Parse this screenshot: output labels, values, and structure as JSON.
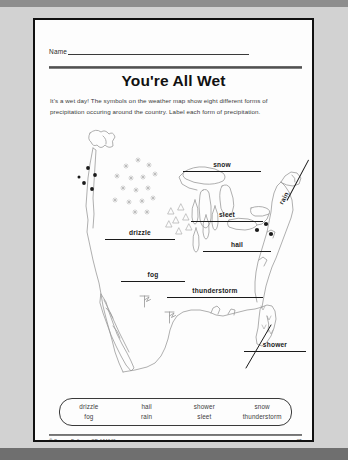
{
  "worksheet": {
    "name_label": "Name",
    "title": "You're All Wet",
    "directions": "It's a wet day! The symbols on the weather map show eight different forms of precipitation occuring around the country. Label each form of precipitation."
  },
  "map_labels": {
    "snow": "snow",
    "sleet": "sleet",
    "drizzle": "drizzle",
    "hail": "hail",
    "rain": "rain",
    "fog": "fog",
    "thunderstorm": "thunderstorm",
    "shower": "shower"
  },
  "word_bank": {
    "columns": [
      {
        "words": [
          "drizzle",
          "fog"
        ]
      },
      {
        "words": [
          "hail",
          "rain"
        ]
      },
      {
        "words": [
          "shower",
          "sleet"
        ]
      },
      {
        "words": [
          "snow",
          "thunderstorm"
        ]
      }
    ]
  },
  "footer": {
    "copyright": "© Carson-Dellosa · CD-104640",
    "page_number": "85"
  },
  "colors": {
    "ink": "#1a1a1a",
    "paper": "#fdfdfd",
    "mat": "#d2d2d2",
    "map_line": "#9a9a9a"
  }
}
